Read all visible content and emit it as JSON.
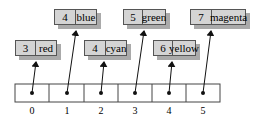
{
  "diagram": {
    "array_indices": [
      "0",
      "1",
      "2",
      "3",
      "4",
      "5"
    ],
    "nodes": [
      {
        "key": "3",
        "value": "red",
        "pointed_by": 0
      },
      {
        "key": "4",
        "value": "blue",
        "pointed_by": 1
      },
      {
        "key": "4",
        "value": "cyan",
        "pointed_by": 2
      },
      {
        "key": "5",
        "value": "green",
        "pointed_by": 3
      },
      {
        "key": "6",
        "value": "yellow",
        "pointed_by": 4
      },
      {
        "key": "7",
        "value": "magenta",
        "pointed_by": 5
      }
    ]
  }
}
